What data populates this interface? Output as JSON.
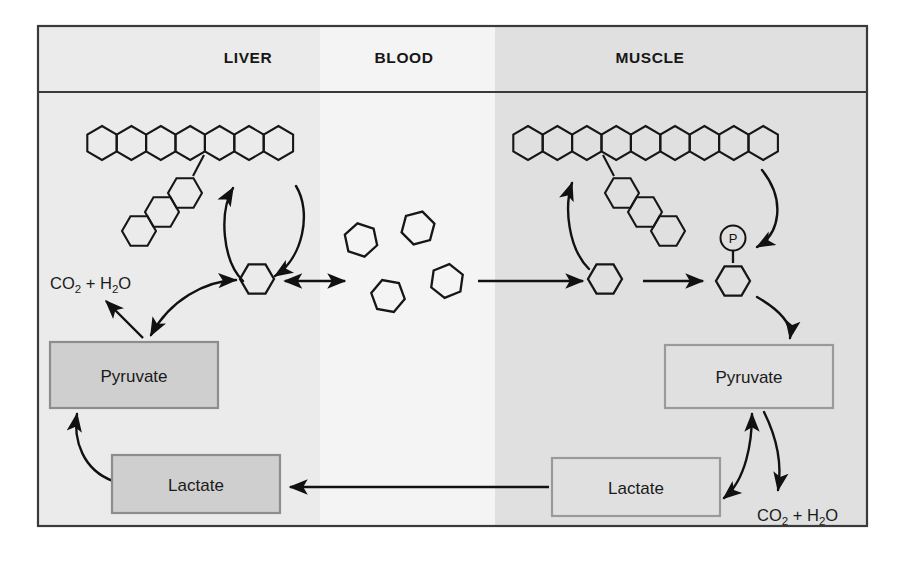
{
  "figure": {
    "frame": {
      "x": 37,
      "y": 25,
      "width": 831,
      "height": 502
    }
  },
  "columns": [
    {
      "id": "liver",
      "label": "LIVER",
      "label_x": 248,
      "x": 38,
      "width": 282,
      "fill": "#ebebeb"
    },
    {
      "id": "blood",
      "label": "BLOOD",
      "label_x": 404,
      "x": 320,
      "width": 175,
      "fill": "#f4f4f4"
    },
    {
      "id": "muscle",
      "label": "MUSCLE",
      "label_x": 650,
      "x": 495,
      "width": 372,
      "fill": "#e0e0e0"
    }
  ],
  "header": {
    "label_baseline_y": 63,
    "divider_y": 92
  },
  "boxes": [
    {
      "id": "liver-pyruvate",
      "label": "Pyruvate",
      "x": 50,
      "y": 342,
      "width": 168,
      "height": 66,
      "style": "filled"
    },
    {
      "id": "liver-lactate",
      "label": "Lactate",
      "x": 112,
      "y": 455,
      "width": 168,
      "height": 58,
      "style": "filled"
    },
    {
      "id": "muscle-pyruvate",
      "label": "Pyruvate",
      "x": 665,
      "y": 345,
      "width": 168,
      "height": 63,
      "style": "open"
    },
    {
      "id": "muscle-lactate",
      "label": "Lactate",
      "x": 552,
      "y": 458,
      "width": 168,
      "height": 58,
      "style": "open"
    }
  ],
  "formulas": [
    {
      "id": "liver-co2-h2o",
      "text": "CO2 + H2O",
      "parts": [
        "CO",
        "2",
        " + H",
        "2",
        "O"
      ],
      "x": 50,
      "y": 289
    },
    {
      "id": "muscle-co2-h2o",
      "text": "CO2 + H2O",
      "parts": [
        "CO",
        "2",
        " + H",
        "2",
        "O"
      ],
      "x": 757,
      "y": 521
    }
  ],
  "molecules": {
    "phosphate_label": "P",
    "liver_glycogen_chain_count": 7,
    "liver_glycogen_branch_count": 3,
    "muscle_glycogen_chain_count": 9,
    "muscle_glycogen_branch_count": 3,
    "blood_glucose_count": 4,
    "liver_glucose_count": 1,
    "muscle_glucose_count": 1,
    "muscle_glucose_phosphate_count": 1
  },
  "colors": {
    "ink": "#161616",
    "frame": "#3a3a3a",
    "box_fill": "#cfcfcf",
    "box_border": "#8d8d8d",
    "liver_bg": "#ebebeb",
    "blood_bg": "#f4f4f4",
    "muscle_bg": "#e0e0e0",
    "page_bg": "#ffffff"
  }
}
